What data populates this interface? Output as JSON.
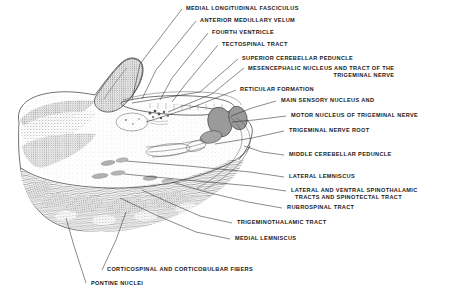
{
  "figure": {
    "background_color": "#ffffff",
    "ink_color": "#2a2a2a",
    "nucleus_fill_color": "#9a9a9a",
    "nucleus_stroke_color": "#4a4a4a"
  },
  "labels": [
    {
      "id": "medial-longitudinal-fasciculus",
      "text": "MEDIAL LONGITUDINAL FASCICULUS"
    },
    {
      "id": "anterior-medullary-velum",
      "text": "ANTERIOR MEDULLARY VELUM"
    },
    {
      "id": "fourth-ventricle",
      "text": "FOURTH VENTRICLE"
    },
    {
      "id": "tectospinal-tract",
      "text": "TECTOSPINAL TRACT"
    },
    {
      "id": "superior-cerebellar-peduncle",
      "text": "SUPERIOR CEREBELLAR PEDUNCLE"
    },
    {
      "id": "mesencephalic-nucleus",
      "line1": "MESENCEPHALIC NUCLEUS AND TRACT OF THE",
      "line2": "TRIGEMINAL NERVE"
    },
    {
      "id": "reticular-formation",
      "text": "RETICULAR FORMATION"
    },
    {
      "id": "main-sensory-nucleus",
      "text": "MAIN SENSORY NUCLEUS AND"
    },
    {
      "id": "motor-nucleus-trigeminal",
      "text": "MOTOR NUCLEUS OF TRIGEMINAL NERVE"
    },
    {
      "id": "trigeminal-nerve-root",
      "text": "TRIGEMINAL NERVE ROOT"
    },
    {
      "id": "middle-cerebellar-peduncle",
      "text": "MIDDLE CEREBELLAR PEDUNCLE"
    },
    {
      "id": "lateral-lemniscus",
      "text": "LATERAL LEMNISCUS"
    },
    {
      "id": "spinothalamic-tracts",
      "line1": "LATERAL AND VENTRAL SPINOTHALAMIC",
      "line2": "TRACTS AND SPINOTECTAL TRACT"
    },
    {
      "id": "rubrospinal-tract",
      "text": "RUBROSPINAL TRACT"
    },
    {
      "id": "trigeminothalamic-tract",
      "text": "TRIGEMINOTHALAMIC TRACT"
    },
    {
      "id": "medial-lemniscus",
      "text": "MEDIAL LEMNISCUS"
    },
    {
      "id": "corticospinal-corticobulbar",
      "text": "CORTICOSPINAL AND CORTICOBULBAR FIBERS"
    },
    {
      "id": "pontine-nuclei",
      "text": "PONTINE NUCLEI"
    }
  ]
}
